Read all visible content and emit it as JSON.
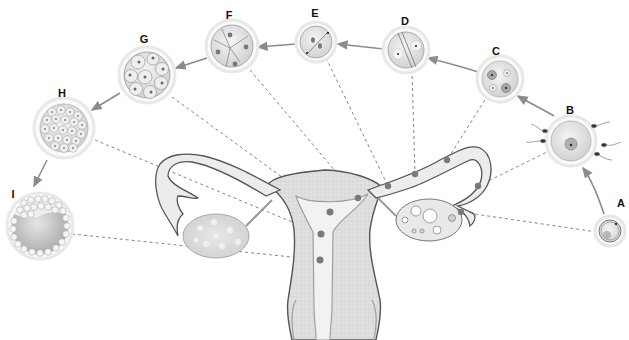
{
  "figure": {
    "stage_labels": {
      "A": "A",
      "B": "B",
      "C": "C",
      "D": "D",
      "E": "E",
      "F": "F",
      "G": "G",
      "H": "H",
      "I": "I"
    },
    "stages": [
      {
        "id": "A",
        "depiction": "ovulated oocyte"
      },
      {
        "id": "B",
        "depiction": "oocyte surrounded by sperm (fertilization)"
      },
      {
        "id": "C",
        "depiction": "zygote with two pronuclei"
      },
      {
        "id": "D",
        "depiction": "first cleavage spindle"
      },
      {
        "id": "E",
        "depiction": "two-cell stage"
      },
      {
        "id": "F",
        "depiction": "four-cell stage"
      },
      {
        "id": "G",
        "depiction": "eight-cell stage"
      },
      {
        "id": "H",
        "depiction": "morula"
      },
      {
        "id": "I",
        "depiction": "blastocyst"
      }
    ],
    "anatomy": [
      "uterus",
      "left ovary",
      "right ovary with follicles",
      "uterine tubes",
      "fimbriae",
      "cervix"
    ],
    "colors": {
      "outline": "#555555",
      "fill": "#e4e4e4",
      "dot": "#7a7a7a",
      "arrow": "#8c8c8c",
      "dash": "#777777"
    }
  }
}
